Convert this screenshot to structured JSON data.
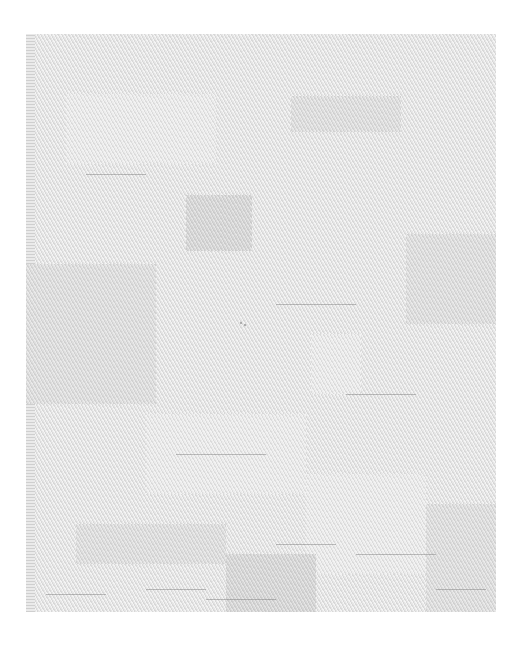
{
  "image": {
    "subject": "white woven textile patchwork",
    "colors": {
      "background": "#ffffff",
      "fabric_base": "#e6e6e6",
      "patch_dark": "#d6d6d6",
      "patch_mid": "#dedede",
      "patch_light": "#ececec",
      "thread": "#8a8a8a"
    },
    "patches": [
      {
        "x": 160,
        "y": 161,
        "w": 66,
        "h": 56,
        "tone": "dark"
      },
      {
        "x": 265,
        "y": 62,
        "w": 110,
        "h": 36,
        "tone": "mid"
      },
      {
        "x": 40,
        "y": 60,
        "w": 150,
        "h": 70,
        "tone": "light"
      },
      {
        "x": 0,
        "y": 230,
        "w": 130,
        "h": 140,
        "tone": "mid"
      },
      {
        "x": 285,
        "y": 300,
        "w": 50,
        "h": 60,
        "tone": "light"
      },
      {
        "x": 380,
        "y": 200,
        "w": 90,
        "h": 90,
        "tone": "mid"
      },
      {
        "x": 120,
        "y": 380,
        "w": 160,
        "h": 80,
        "tone": "light"
      },
      {
        "x": 50,
        "y": 490,
        "w": 150,
        "h": 40,
        "tone": "mid"
      },
      {
        "x": 280,
        "y": 440,
        "w": 120,
        "h": 100,
        "tone": "light"
      },
      {
        "x": 400,
        "y": 470,
        "w": 70,
        "h": 108,
        "tone": "mid"
      },
      {
        "x": 200,
        "y": 520,
        "w": 90,
        "h": 58,
        "tone": "dark"
      }
    ],
    "threads": [
      {
        "x": 60,
        "y": 140,
        "w": 60
      },
      {
        "x": 250,
        "y": 270,
        "w": 80
      },
      {
        "x": 320,
        "y": 360,
        "w": 70
      },
      {
        "x": 150,
        "y": 420,
        "w": 90
      },
      {
        "x": 250,
        "y": 510,
        "w": 60
      },
      {
        "x": 330,
        "y": 520,
        "w": 80
      },
      {
        "x": 20,
        "y": 560,
        "w": 60
      },
      {
        "x": 120,
        "y": 555,
        "w": 60
      },
      {
        "x": 410,
        "y": 555,
        "w": 50
      },
      {
        "x": 180,
        "y": 565,
        "w": 70
      }
    ],
    "marks": [
      {
        "x": 214,
        "y": 286
      }
    ]
  }
}
